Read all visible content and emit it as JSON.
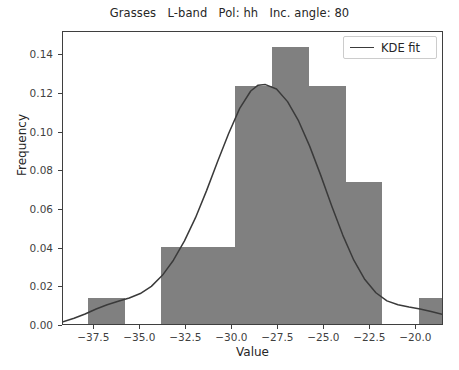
{
  "chart_data": {
    "type": "bar",
    "title": "Grasses   L-band   Pol: hh   Inc. angle: 80",
    "xlabel": "Value",
    "ylabel": "Frequency",
    "xlim": [
      -39.2,
      -18.5
    ],
    "ylim": [
      0.0,
      0.152
    ],
    "xticks": [
      -37.5,
      -35.0,
      -32.5,
      -30.0,
      -27.5,
      -25.0,
      -22.5,
      -20.0
    ],
    "xtick_labels": [
      "−37.5",
      "−35.0",
      "−32.5",
      "−30.0",
      "−27.5",
      "−25.0",
      "−22.5",
      "−20.0"
    ],
    "yticks": [
      0.0,
      0.02,
      0.04,
      0.06,
      0.08,
      0.1,
      0.12,
      0.14
    ],
    "ytick_labels": [
      "0.00",
      "0.02",
      "0.04",
      "0.06",
      "0.08",
      "0.10",
      "0.12",
      "0.14"
    ],
    "grid": false,
    "legend_position": "upper right",
    "bar_color": "#808080",
    "line_color": "#3a3a3a",
    "bins": [
      {
        "x0": -37.85,
        "x1": -35.85,
        "value": 0.0133
      },
      {
        "x0": -35.85,
        "x1": -33.85,
        "value": 0.0
      },
      {
        "x0": -33.85,
        "x1": -31.85,
        "value": 0.04
      },
      {
        "x0": -31.85,
        "x1": -29.85,
        "value": 0.04
      },
      {
        "x0": -29.85,
        "x1": -27.85,
        "value": 0.1233
      },
      {
        "x0": -27.85,
        "x1": -25.85,
        "value": 0.1433
      },
      {
        "x0": -25.85,
        "x1": -23.85,
        "value": 0.1233
      },
      {
        "x0": -23.85,
        "x1": -21.85,
        "value": 0.0733
      },
      {
        "x0": -21.85,
        "x1": -19.85,
        "value": 0.0
      },
      {
        "x0": -19.85,
        "x1": -17.85,
        "value": 0.0133
      }
    ],
    "series": [
      {
        "name": "KDE fit",
        "type": "line",
        "x": [
          -39.2,
          -38.6,
          -38.0,
          -37.4,
          -36.8,
          -36.2,
          -35.6,
          -35.0,
          -34.4,
          -33.8,
          -33.2,
          -32.6,
          -32.0,
          -31.4,
          -30.8,
          -30.2,
          -29.6,
          -29.0,
          -28.6,
          -28.2,
          -27.6,
          -27.0,
          -26.4,
          -25.8,
          -25.2,
          -24.6,
          -24.0,
          -23.4,
          -22.8,
          -22.2,
          -21.6,
          -21.0,
          -20.4,
          -19.8,
          -19.2,
          -18.5
        ],
        "y": [
          0.0022,
          0.004,
          0.0062,
          0.0088,
          0.011,
          0.0128,
          0.0145,
          0.0168,
          0.0205,
          0.0262,
          0.034,
          0.044,
          0.056,
          0.07,
          0.085,
          0.0995,
          0.1125,
          0.1215,
          0.1245,
          0.1248,
          0.1225,
          0.116,
          0.106,
          0.093,
          0.078,
          0.062,
          0.047,
          0.034,
          0.024,
          0.0172,
          0.013,
          0.011,
          0.0098,
          0.0088,
          0.0075,
          0.0058
        ]
      }
    ]
  },
  "legend": {
    "entries": [
      {
        "label": "KDE fit",
        "color": "#3a3a3a"
      }
    ]
  }
}
